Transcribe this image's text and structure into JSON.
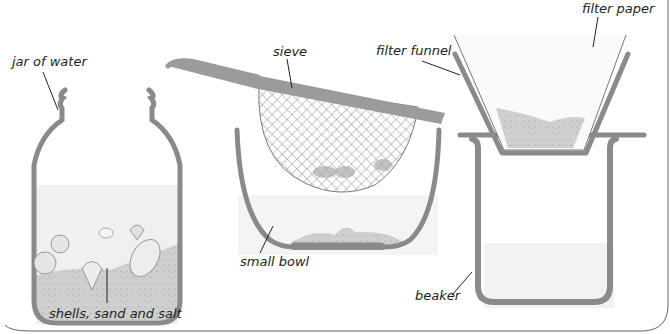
{
  "figure": {
    "labels": {
      "jar": "jar of water",
      "mixture": "shells, sand and salt",
      "sieve": "sieve",
      "bowl": "small bowl",
      "funnel": "filter funnel",
      "paper": "filter paper",
      "beaker": "beaker"
    },
    "colors": {
      "vessel": "#8a8a8a",
      "sand": "#c9c9c9",
      "water": "#f1f1f1",
      "mesh": "#7a7a7a",
      "border": "#666666"
    }
  }
}
